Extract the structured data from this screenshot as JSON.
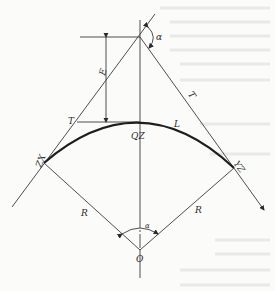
{
  "diagram": {
    "type": "circular-curve-geometry",
    "labels": {
      "alpha_top": "α",
      "alpha_center": "α",
      "external_distance": "E",
      "tangent_left": "T",
      "tangent_right": "T",
      "curve_length": "L",
      "mid_point": "QZ",
      "start_point": "ZX",
      "end_point": "YZ",
      "radius_left": "R",
      "radius_right": "R",
      "center": "O"
    },
    "colors": {
      "line": "#3a3a3a",
      "curve": "#1e1e1e",
      "background": "#fbfbfa"
    }
  }
}
